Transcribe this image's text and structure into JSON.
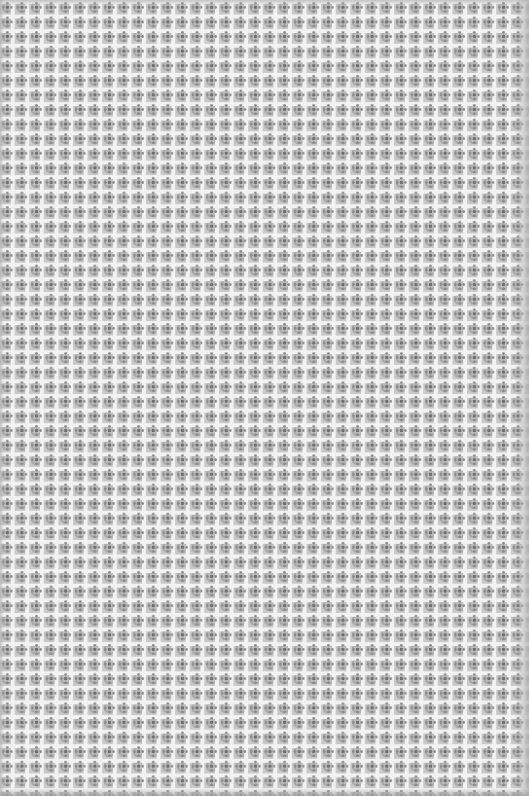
{
  "image": {
    "subject": "grayscale repeating geometric textile pattern",
    "width": 529,
    "height": 796,
    "tile_period_px": 14.6,
    "colors": {
      "base": "#c8c8c8",
      "grid_lines": "#f2f2f2",
      "motif_dark": "#6e6e6e",
      "motif_mid": "#8a8a8a",
      "edge_shade": "#b4b4b4"
    }
  }
}
